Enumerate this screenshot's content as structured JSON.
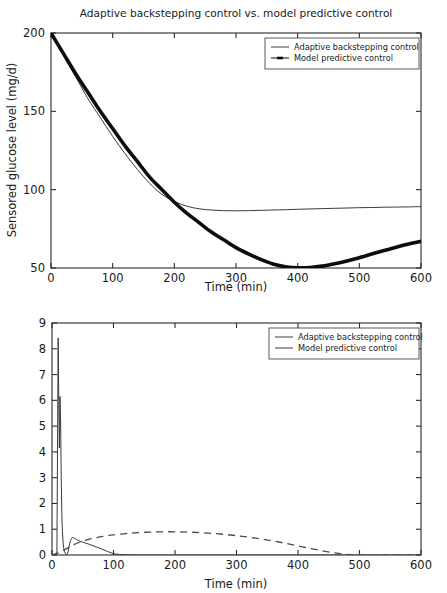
{
  "figure": {
    "name": "glucose-insulin-control-comparison",
    "panel_count": 2
  },
  "chart_data": [
    {
      "id": "top",
      "type": "line",
      "title": "Adaptive backstepping control vs. model predictive control",
      "xlabel": "Time (min)",
      "ylabel": "Sensored glucose level (mg/d)",
      "xlim": [
        0,
        600
      ],
      "ylim": [
        50,
        200
      ],
      "xticks": [
        0,
        100,
        200,
        300,
        400,
        500,
        600
      ],
      "yticks": [
        50,
        100,
        150,
        200
      ],
      "grid": false,
      "legend_position": "upper right",
      "series": [
        {
          "name": "Adaptive backstepping control",
          "style": "solid-thin",
          "marker": "none",
          "color": "#3a3a3a",
          "x": [
            0,
            20,
            40,
            60,
            80,
            100,
            120,
            140,
            160,
            180,
            200,
            220,
            240,
            260,
            280,
            300,
            320,
            340,
            360,
            380,
            400,
            420,
            440,
            460,
            480,
            500,
            520,
            540,
            560,
            580,
            600
          ],
          "y": [
            200,
            186,
            172,
            158,
            146,
            134,
            123,
            113,
            104,
            97,
            92.5,
            89.5,
            87.8,
            87.0,
            86.6,
            86.5,
            86.6,
            86.8,
            87.0,
            87.2,
            87.5,
            87.7,
            87.9,
            88.1,
            88.3,
            88.5,
            88.6,
            88.8,
            88.9,
            89.0,
            89.2
          ]
        },
        {
          "name": "Model predictive control",
          "style": "solid-thick",
          "marker": "line-dot",
          "color": "#0d0d0d",
          "x": [
            0,
            20,
            40,
            60,
            80,
            100,
            120,
            140,
            160,
            180,
            200,
            220,
            240,
            260,
            280,
            300,
            320,
            340,
            360,
            380,
            400,
            420,
            440,
            460,
            480,
            500,
            520,
            540,
            560,
            580,
            600
          ],
          "y": [
            200,
            187,
            174,
            162,
            150,
            139,
            128,
            118,
            108,
            100,
            92,
            85,
            79,
            73,
            68,
            63,
            59,
            55.5,
            52.6,
            50.8,
            50.1,
            50.3,
            51.2,
            52.7,
            54.5,
            56.6,
            58.9,
            61.2,
            63.3,
            65.3,
            67.0
          ]
        }
      ]
    },
    {
      "id": "bottom",
      "type": "line",
      "title": "",
      "xlabel": "Time (min)",
      "ylabel": "Insulin infusion rate (U/h)",
      "xlim": [
        0,
        600
      ],
      "ylim": [
        0,
        9
      ],
      "xticks": [
        0,
        100,
        200,
        300,
        400,
        500,
        600
      ],
      "yticks": [
        0,
        1,
        2,
        3,
        4,
        5,
        6,
        7,
        8,
        9
      ],
      "grid": false,
      "legend_position": "upper right",
      "series": [
        {
          "name": "Adaptive backstepping control",
          "style": "solid-thin",
          "marker": "none",
          "color": "#3a3a3a",
          "x": [
            0,
            4,
            8,
            9,
            10,
            11,
            12,
            13,
            14,
            15,
            16,
            17,
            18,
            19,
            20,
            22,
            24,
            26,
            28,
            30,
            33,
            36,
            40,
            45,
            50,
            60,
            70,
            80,
            90,
            100,
            110,
            120,
            140,
            170,
            200,
            300,
            400,
            500,
            600
          ],
          "y": [
            0,
            0.02,
            0.05,
            4.2,
            8.42,
            6.0,
            4.15,
            6.15,
            5.2,
            3.0,
            1.6,
            0.9,
            0.5,
            0.28,
            0.15,
            0.05,
            0.0,
            0.12,
            0.35,
            0.56,
            0.68,
            0.66,
            0.6,
            0.54,
            0.5,
            0.42,
            0.33,
            0.24,
            0.14,
            0.05,
            0.02,
            0.01,
            0.0,
            0.0,
            0.0,
            0.0,
            0.0,
            0.0,
            0.0
          ]
        },
        {
          "name": "Model predictive control",
          "style": "dashed",
          "marker": "none",
          "color": "#4a4a4a",
          "x": [
            0,
            10,
            20,
            30,
            40,
            50,
            60,
            70,
            80,
            90,
            100,
            120,
            140,
            160,
            180,
            200,
            220,
            240,
            260,
            280,
            300,
            320,
            340,
            360,
            380,
            400,
            420,
            440,
            460,
            480,
            500,
            550,
            600
          ],
          "y": [
            0.0,
            0.08,
            0.2,
            0.33,
            0.45,
            0.54,
            0.61,
            0.66,
            0.71,
            0.75,
            0.78,
            0.83,
            0.87,
            0.89,
            0.9,
            0.9,
            0.89,
            0.87,
            0.84,
            0.8,
            0.75,
            0.69,
            0.62,
            0.54,
            0.45,
            0.35,
            0.25,
            0.16,
            0.08,
            0.02,
            0.0,
            0.0,
            0.0
          ]
        }
      ]
    }
  ],
  "panels": {
    "top": {
      "title": "Adaptive backstepping control vs. model predictive control",
      "xlabel": "Time (min)",
      "ylabel": "Sensored glucose level (mg/d)",
      "xticklabels": [
        "0",
        "100",
        "200",
        "300",
        "400",
        "500",
        "600"
      ],
      "yticklabels": [
        "50",
        "100",
        "150",
        "200"
      ],
      "legend": {
        "items": [
          {
            "label": "Adaptive backstepping control",
            "sample": "line"
          },
          {
            "label": "Model predictive control",
            "sample": "line-marker"
          }
        ]
      }
    },
    "bottom": {
      "title": "",
      "xlabel": "Time (min)",
      "ylabel": "Insulin infusion rate (U/h)",
      "xticklabels": [
        "0",
        "100",
        "200",
        "300",
        "400",
        "500",
        "600"
      ],
      "yticklabels": [
        "0",
        "1",
        "2",
        "3",
        "4",
        "5",
        "6",
        "7",
        "8",
        "9"
      ],
      "legend": {
        "items": [
          {
            "label": "Adaptive backstepping control",
            "sample": "line"
          },
          {
            "label": "Model predictive control",
            "sample": "line"
          }
        ]
      }
    }
  },
  "colors": {
    "axis": "#2b2b2b",
    "abc_series": "#3a3a3a",
    "mpc_series": "#0d0d0d",
    "mpc_dashed": "#4a4a4a",
    "background": "#ffffff"
  }
}
